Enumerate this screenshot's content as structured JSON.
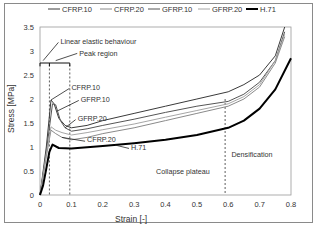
{
  "chart_data": {
    "type": "line",
    "title": "",
    "xlabel": "Strain [-]",
    "ylabel": "Stress [MPa]",
    "xlim": [
      0,
      0.8
    ],
    "ylim": [
      0,
      3.5
    ],
    "xticks": [
      "0",
      "0.1",
      "0.2",
      "0.3",
      "0.4",
      "0.5",
      "0.6",
      "0.7",
      "0.8"
    ],
    "yticks": [
      "0",
      "0.5",
      "1",
      "1.5",
      "2",
      "2.5",
      "3",
      "3.5"
    ],
    "grid": false,
    "legend_position": "top",
    "legend": [
      "CFRP.10",
      "CFRP.20",
      "GFRP.10",
      "GFRP.20",
      "H.71"
    ],
    "series": [
      {
        "name": "CFRP.10",
        "color": "#3a3a3a",
        "width": 1.0,
        "x": [
          0,
          0.02,
          0.035,
          0.045,
          0.06,
          0.08,
          0.1,
          0.15,
          0.2,
          0.3,
          0.4,
          0.5,
          0.6,
          0.65,
          0.7,
          0.75,
          0.78
        ],
        "y": [
          0,
          1.0,
          1.98,
          1.9,
          1.6,
          1.45,
          1.4,
          1.45,
          1.55,
          1.7,
          1.85,
          2.0,
          2.15,
          2.3,
          2.5,
          2.9,
          3.5
        ]
      },
      {
        "name": "CFRP.20",
        "color": "#8a8a8a",
        "width": 1.0,
        "x": [
          0,
          0.02,
          0.035,
          0.05,
          0.07,
          0.1,
          0.15,
          0.2,
          0.3,
          0.4,
          0.5,
          0.6,
          0.65,
          0.7,
          0.75,
          0.78
        ],
        "y": [
          0,
          0.8,
          1.35,
          1.28,
          1.2,
          1.15,
          1.2,
          1.28,
          1.4,
          1.55,
          1.7,
          1.85,
          2.0,
          2.25,
          2.75,
          3.3
        ]
      },
      {
        "name": "GFRP.10",
        "color": "#555555",
        "width": 1.0,
        "x": [
          0,
          0.02,
          0.04,
          0.05,
          0.065,
          0.08,
          0.1,
          0.15,
          0.2,
          0.3,
          0.4,
          0.5,
          0.6,
          0.65,
          0.7,
          0.75,
          0.78
        ],
        "y": [
          0,
          0.9,
          1.9,
          1.88,
          1.55,
          1.4,
          1.33,
          1.38,
          1.45,
          1.58,
          1.72,
          1.85,
          1.95,
          2.1,
          2.35,
          2.8,
          3.4
        ]
      },
      {
        "name": "GFRP.20",
        "color": "#a6a6a6",
        "width": 1.0,
        "x": [
          0,
          0.02,
          0.035,
          0.05,
          0.07,
          0.1,
          0.15,
          0.2,
          0.3,
          0.4,
          0.5,
          0.6,
          0.65,
          0.7,
          0.75,
          0.78
        ],
        "y": [
          0,
          0.85,
          1.42,
          1.35,
          1.3,
          1.25,
          1.3,
          1.36,
          1.48,
          1.62,
          1.76,
          1.9,
          2.05,
          2.3,
          2.8,
          3.35
        ]
      },
      {
        "name": "H.71",
        "color": "#000000",
        "width": 2.0,
        "x": [
          0,
          0.01,
          0.02,
          0.03,
          0.04,
          0.06,
          0.1,
          0.2,
          0.3,
          0.4,
          0.5,
          0.6,
          0.65,
          0.7,
          0.75,
          0.8
        ],
        "y": [
          0,
          0.2,
          0.55,
          0.9,
          1.05,
          0.98,
          0.97,
          1.02,
          1.08,
          1.15,
          1.25,
          1.4,
          1.55,
          1.8,
          2.2,
          2.85
        ]
      }
    ],
    "annotations": [
      {
        "text": "Linear elastic behaviour",
        "x": 0.065,
        "y": 3.2
      },
      {
        "text": "Peak region",
        "x": 0.125,
        "y": 2.95
      },
      {
        "text": "CFRP.10",
        "x": 0.1,
        "y": 2.25
      },
      {
        "text": "GFRP.10",
        "x": 0.13,
        "y": 2.0
      },
      {
        "text": "GFRP.20",
        "x": 0.12,
        "y": 1.6
      },
      {
        "text": "CFRP.20",
        "x": 0.15,
        "y": 1.15
      },
      {
        "text": "H.71",
        "x": 0.29,
        "y": 1.0
      },
      {
        "text": "Collapse plateau",
        "x": 0.37,
        "y": 0.5
      },
      {
        "text": "Densification",
        "x": 0.61,
        "y": 0.85
      }
    ],
    "reference_lines": [
      {
        "type": "vertical-dashed",
        "x": 0.03
      },
      {
        "type": "vertical-dashed",
        "x": 0.095
      },
      {
        "type": "vertical-dashed",
        "x": 0.59
      }
    ]
  }
}
